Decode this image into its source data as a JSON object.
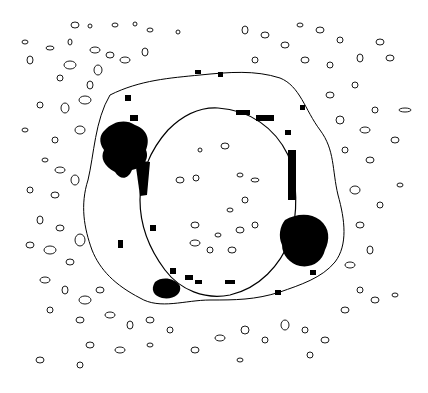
{
  "figure": {
    "background": "#ffffff",
    "ink": "#000000",
    "inner_ring": {
      "cx": 218,
      "cy": 202,
      "rx": 78,
      "ry": 94
    },
    "outer_contour": {
      "cx": 212,
      "cy": 200,
      "rx": 128,
      "ry": 132
    },
    "dark_patches": [
      {
        "name": "upper-left-blob",
        "cx": 125,
        "cy": 150,
        "rx": 22,
        "ry": 22
      },
      {
        "name": "lower-right-blob",
        "cx": 305,
        "cy": 240,
        "rx": 22,
        "ry": 24
      },
      {
        "name": "lower-left-blob",
        "cx": 165,
        "cy": 290,
        "rx": 14,
        "ry": 10
      },
      {
        "name": "right-streak",
        "cx": 292,
        "cy": 180,
        "rx": 4,
        "ry": 24
      },
      {
        "name": "top-streak",
        "cx": 262,
        "cy": 120,
        "rx": 12,
        "ry": 5
      }
    ]
  }
}
